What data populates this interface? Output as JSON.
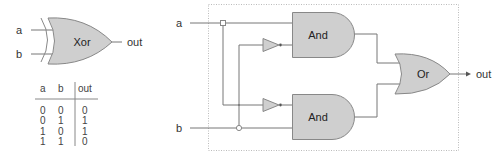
{
  "colors": {
    "gate_fill": "#cfcfcf",
    "gate_stroke": "#888888",
    "wire": "#777777",
    "dotted_box": "#bbbbbb",
    "text": "#333333"
  },
  "xor_symbol": {
    "gate_label": "Xor",
    "inputs": [
      "a",
      "b"
    ],
    "output": "out"
  },
  "truth_table": {
    "headers": [
      "a",
      "b",
      "out"
    ],
    "rows": [
      [
        "0",
        "0",
        "0"
      ],
      [
        "0",
        "1",
        "1"
      ],
      [
        "1",
        "0",
        "1"
      ],
      [
        "1",
        "1",
        "0"
      ]
    ]
  },
  "circuit": {
    "inputs": [
      "a",
      "b"
    ],
    "output": "out",
    "gates": {
      "and_top": "And",
      "and_bottom": "And",
      "or": "Or"
    }
  }
}
